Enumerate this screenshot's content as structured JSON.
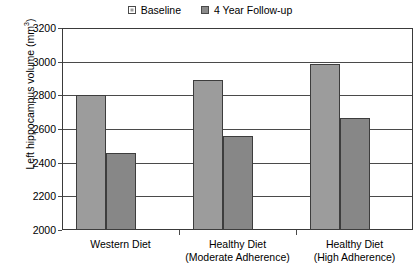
{
  "chart_data": {
    "type": "bar",
    "title": "",
    "subtitle": "",
    "xlabel": "",
    "ylabel": "Left hippocampus volume (mm3)",
    "ylabel_base": "Left hippocampus volume (mm",
    "ylabel_sup": "3",
    "ylabel_close": ")",
    "ylim": [
      2000,
      3200
    ],
    "ytick_step": 200,
    "yticks": [
      "3200",
      "3000",
      "2800",
      "2600",
      "2400",
      "2200",
      "2000"
    ],
    "ytick_values": [
      3200,
      3000,
      2800,
      2600,
      2400,
      2200,
      2000
    ],
    "grid": "horizontal",
    "legend_position": "top-center",
    "categories": [
      "Western Diet",
      "Healthy Diet (Moderate Adherence)",
      "Healthy Diet (High Adherence)"
    ],
    "category_lines": [
      {
        "line1": "Western Diet",
        "line2": ""
      },
      {
        "line1": "Healthy Diet",
        "line2": "(Moderate Adherence)"
      },
      {
        "line1": "Healthy Diet",
        "line2": "(High Adherence)"
      }
    ],
    "series": [
      {
        "name": "Baseline",
        "color": "#9c9c9c",
        "values": [
          2800,
          2890,
          2985
        ]
      },
      {
        "name": "4 Year Follow-up",
        "color": "#878787",
        "values": [
          2455,
          2560,
          2665
        ]
      }
    ]
  },
  "legend": {
    "items": [
      {
        "label": "Baseline",
        "swatch": "baseline-swatch-icon"
      },
      {
        "label": "4 Year Follow-up",
        "swatch": "followup-swatch-icon"
      }
    ]
  },
  "colors": {
    "baseline": "#9c9c9c",
    "followup": "#878787",
    "axis": "#3a3a3a",
    "grid": "#4a4a4a",
    "background": "#ffffff"
  }
}
